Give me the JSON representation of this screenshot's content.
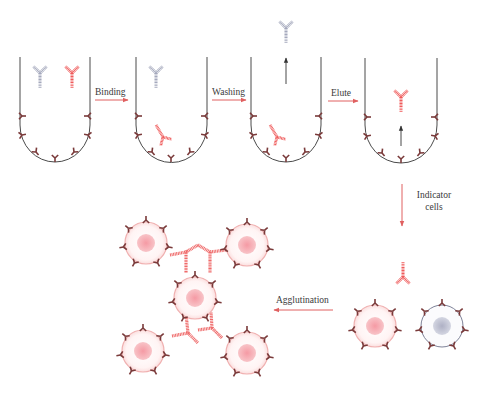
{
  "diagram": {
    "colors": {
      "background": "#ffffff",
      "tube_outline": "#4a4a4a",
      "antigen": "#7a3a3a",
      "specific_antibody": "#ef5a5a",
      "nonspecific_antibody": "#9aa0b4",
      "step_arrow": "#e06060",
      "lift_arrow": "#333333",
      "cell_membrane": "#f2b8b8",
      "cell_fill": "#fff6f6",
      "cell_nucleus": "#f4a0a8",
      "control_cell_membrane": "#8a8ea8",
      "control_cell_nucleus": "#b4b6c8",
      "label_text": "#3a3a3a"
    },
    "steps": [
      {
        "label": "Binding"
      },
      {
        "label": "Washing"
      },
      {
        "label": "Elute"
      },
      {
        "label_line1": "Indicator",
        "label_line2": "cells"
      },
      {
        "label": "Agglutination"
      }
    ],
    "panels": [
      {
        "name": "well-1-initial",
        "contents": [
          "non-specific antibody (gray)",
          "specific antibody (red)"
        ]
      },
      {
        "name": "well-2-bound",
        "contents": [
          "non-specific antibody free",
          "specific antibody bound to antigen"
        ]
      },
      {
        "name": "well-3-washed",
        "contents": [
          "non-specific antibody washed away (up arrow)",
          "specific antibody bound"
        ]
      },
      {
        "name": "well-4-eluted",
        "contents": [
          "specific antibody released (up arrow)"
        ]
      },
      {
        "name": "indicator-cells",
        "contents": [
          "eluted antibody",
          "antigen-positive red cell",
          "antigen-negative control cell"
        ]
      },
      {
        "name": "agglutinated-cells",
        "contents": [
          "five red cells crosslinked by antibodies"
        ]
      }
    ]
  }
}
